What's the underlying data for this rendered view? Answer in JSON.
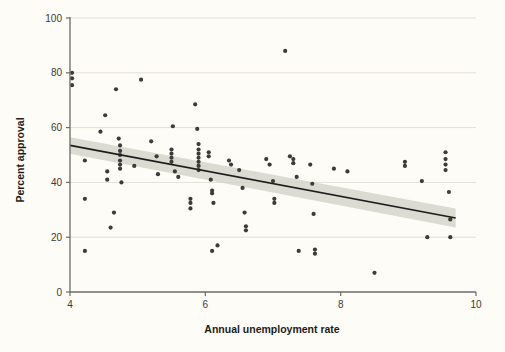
{
  "figure": {
    "background_color": "#fdfcf6",
    "plot_background_color": "#fdfcf6"
  },
  "axes": {
    "x_label": "Annual unemployment rate",
    "y_label": "Percent approval",
    "x_ticks": [
      "4",
      "6",
      "8",
      "10"
    ],
    "y_ticks": [
      "0",
      "20",
      "40",
      "60",
      "80",
      "100"
    ]
  },
  "colors": {
    "point": "#3b3b39",
    "line": "#1d1d1b",
    "band": "#cfd0c6",
    "grid": "#e3e2d8",
    "axis": "#6b6b66",
    "text": "#1d1d1b"
  },
  "chart_data": {
    "type": "scatter",
    "title": "",
    "xlabel": "Annual unemployment rate",
    "ylabel": "Percent approval",
    "xlim": [
      4,
      10
    ],
    "ylim": [
      0,
      100
    ],
    "xticks": [
      4,
      6,
      8,
      10
    ],
    "yticks": [
      0,
      20,
      40,
      60,
      80,
      100
    ],
    "grid": "horizontal",
    "legend": "none",
    "points": [
      [
        4.03,
        80.0
      ],
      [
        4.03,
        78.0
      ],
      [
        4.03,
        75.5
      ],
      [
        4.22,
        48.0
      ],
      [
        4.22,
        34.0
      ],
      [
        4.22,
        15.0
      ],
      [
        4.45,
        58.5
      ],
      [
        4.52,
        64.5
      ],
      [
        4.55,
        44.0
      ],
      [
        4.55,
        41.0
      ],
      [
        4.6,
        23.5
      ],
      [
        4.65,
        29.0
      ],
      [
        4.68,
        74.0
      ],
      [
        4.72,
        56.0
      ],
      [
        4.74,
        53.5
      ],
      [
        4.74,
        51.5
      ],
      [
        4.74,
        50.0
      ],
      [
        4.74,
        48.0
      ],
      [
        4.74,
        46.5
      ],
      [
        4.74,
        45.0
      ],
      [
        4.76,
        40.0
      ],
      [
        4.95,
        46.0
      ],
      [
        5.05,
        77.5
      ],
      [
        5.2,
        55.0
      ],
      [
        5.28,
        49.5
      ],
      [
        5.3,
        43.0
      ],
      [
        5.5,
        52.0
      ],
      [
        5.5,
        50.5
      ],
      [
        5.5,
        49.0
      ],
      [
        5.5,
        47.5
      ],
      [
        5.52,
        60.5
      ],
      [
        5.55,
        44.0
      ],
      [
        5.6,
        42.0
      ],
      [
        5.78,
        34.0
      ],
      [
        5.78,
        32.5
      ],
      [
        5.78,
        30.5
      ],
      [
        5.85,
        68.5
      ],
      [
        5.88,
        59.5
      ],
      [
        5.9,
        54.0
      ],
      [
        5.9,
        52.0
      ],
      [
        5.9,
        50.5
      ],
      [
        5.9,
        49.0
      ],
      [
        5.9,
        47.5
      ],
      [
        5.9,
        46.0
      ],
      [
        5.9,
        44.5
      ],
      [
        6.05,
        51.0
      ],
      [
        6.05,
        49.5
      ],
      [
        6.08,
        41.0
      ],
      [
        6.1,
        37.0
      ],
      [
        6.1,
        36.0
      ],
      [
        6.12,
        32.5
      ],
      [
        6.1,
        15.0
      ],
      [
        6.18,
        17.0
      ],
      [
        6.35,
        48.0
      ],
      [
        6.38,
        46.5
      ],
      [
        6.5,
        44.5
      ],
      [
        6.55,
        38.0
      ],
      [
        6.58,
        29.0
      ],
      [
        6.6,
        24.0
      ],
      [
        6.6,
        22.5
      ],
      [
        6.9,
        48.5
      ],
      [
        6.95,
        46.5
      ],
      [
        7.0,
        40.5
      ],
      [
        7.02,
        34.0
      ],
      [
        7.02,
        32.5
      ],
      [
        7.18,
        88.0
      ],
      [
        7.25,
        49.5
      ],
      [
        7.3,
        48.5
      ],
      [
        7.3,
        47.0
      ],
      [
        7.35,
        42.0
      ],
      [
        7.38,
        15.0
      ],
      [
        7.55,
        46.5
      ],
      [
        7.58,
        39.5
      ],
      [
        7.6,
        28.5
      ],
      [
        7.62,
        15.5
      ],
      [
        7.62,
        14.0
      ],
      [
        7.9,
        45.0
      ],
      [
        8.1,
        44.0
      ],
      [
        8.5,
        7.0
      ],
      [
        8.95,
        47.5
      ],
      [
        8.95,
        46.0
      ],
      [
        9.2,
        40.5
      ],
      [
        9.28,
        20.0
      ],
      [
        9.55,
        51.0
      ],
      [
        9.55,
        48.5
      ],
      [
        9.55,
        46.5
      ],
      [
        9.55,
        44.5
      ],
      [
        9.6,
        36.5
      ],
      [
        9.62,
        26.5
      ],
      [
        9.62,
        20.0
      ]
    ],
    "fit_line": {
      "type": "linear regression with 95% confidence band",
      "x": [
        4.0,
        9.7
      ],
      "y": [
        53.5,
        27.0
      ],
      "band_upper": [
        56.5,
        30.5
      ],
      "band_lower": [
        50.5,
        23.5
      ]
    }
  }
}
